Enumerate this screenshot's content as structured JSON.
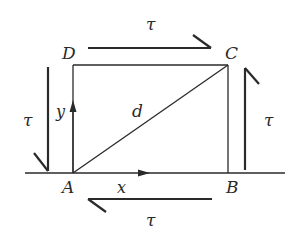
{
  "diagram": {
    "type": "shear-stress-element",
    "colors": {
      "line": "#2a2a2a",
      "background": "#ffffff"
    },
    "vertices": {
      "A": {
        "label": "A"
      },
      "B": {
        "label": "B"
      },
      "C": {
        "label": "C"
      },
      "D": {
        "label": "D"
      }
    },
    "edges": {
      "diagonal": {
        "label": "d"
      },
      "x_axis": {
        "label": "x"
      },
      "y_axis": {
        "label": "y"
      }
    },
    "stress_arrows": {
      "top": {
        "label": "τ",
        "direction": "right"
      },
      "bottom": {
        "label": "τ",
        "direction": "left"
      },
      "left": {
        "label": "τ",
        "direction": "down"
      },
      "right": {
        "label": "τ",
        "direction": "up"
      }
    }
  }
}
